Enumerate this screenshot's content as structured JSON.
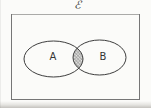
{
  "figure": {
    "universal_set_symbol": "ℰ",
    "sets": [
      {
        "label": "A"
      },
      {
        "label": "B"
      }
    ],
    "shaded_region": "A ∩ B",
    "colors": {
      "paper": "#fbfbf9",
      "ellipse_stroke": "#3e3e3e",
      "rectangle_stroke": "#767676",
      "hatch_line": "#777777",
      "hatch_background": "#ececea",
      "scan_shadow": "#a09c94"
    }
  }
}
